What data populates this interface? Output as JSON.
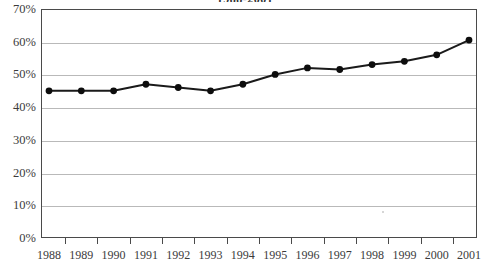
{
  "chart_data": {
    "type": "line",
    "title": "1988-2001",
    "subtitle": "",
    "xlabel": "",
    "ylabel": "",
    "categories": [
      "1988",
      "1989",
      "1990",
      "1991",
      "1992",
      "1993",
      "1994",
      "1995",
      "1996",
      "1997",
      "1998",
      "1999",
      "2000",
      "2001"
    ],
    "values": [
      45,
      45,
      45,
      47,
      46,
      45,
      47,
      50,
      52,
      51.5,
      53,
      54,
      56,
      60.5
    ],
    "series": [
      {
        "name": "Percentage",
        "values": [
          45,
          45,
          45,
          47,
          46,
          45,
          47,
          50,
          52,
          51.5,
          53,
          54,
          56,
          60.5
        ]
      }
    ],
    "ylim": [
      0,
      70
    ],
    "ytick_values": [
      0,
      10,
      20,
      30,
      40,
      50,
      60,
      70
    ],
    "ytick_labels": [
      "0%",
      "10%",
      "20%",
      "30%",
      "40%",
      "50%",
      "60%",
      "70%"
    ],
    "xtick_labels": [
      "1988",
      "1989",
      "1990",
      "1991",
      "1992",
      "1993",
      "1994",
      "1995",
      "1996",
      "1997",
      "1998",
      "1999",
      "2000",
      "2001"
    ],
    "grid": true,
    "grid_axis": "y",
    "legend": false,
    "legend_position": "none",
    "marker": "circle",
    "annotations": []
  },
  "style": {
    "line_color": "#1a1a1a",
    "marker_color": "#0d0d0d",
    "grid_color": "#b9b9b9",
    "axis_color": "#4a4a4a",
    "text_color": "#3b3b3b",
    "background": "#ffffff"
  }
}
